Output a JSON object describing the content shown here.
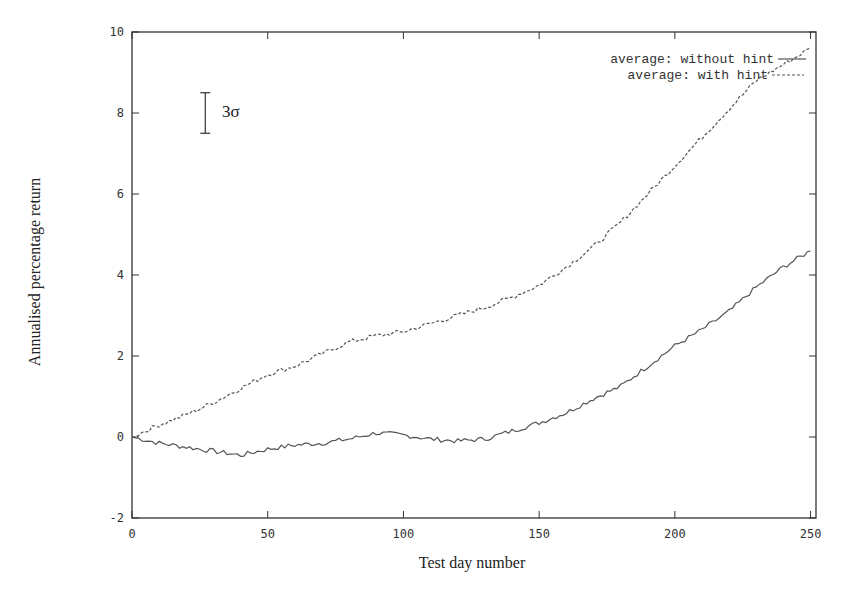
{
  "chart_data": {
    "type": "line",
    "title": "",
    "xlabel": "Test day number",
    "ylabel": "Annualised percentage return",
    "xlim": [
      0,
      252
    ],
    "ylim": [
      -2,
      10
    ],
    "xticks": [
      0,
      50,
      100,
      150,
      200,
      250
    ],
    "yticks": [
      -2,
      0,
      2,
      4,
      6,
      8,
      10
    ],
    "grid": false,
    "legend_position": "top-right",
    "annotation": {
      "label": "3σ",
      "type": "error-bar",
      "x": 27,
      "y_low": 7.5,
      "y_high": 8.5
    },
    "x": [
      0,
      10,
      20,
      30,
      40,
      50,
      60,
      70,
      80,
      90,
      100,
      110,
      120,
      130,
      140,
      150,
      160,
      170,
      180,
      190,
      200,
      210,
      220,
      230,
      240,
      250
    ],
    "series": [
      {
        "name": "average: without hint",
        "style": "solid",
        "values": [
          0,
          -0.15,
          -0.25,
          -0.35,
          -0.45,
          -0.3,
          -0.2,
          -0.15,
          -0.05,
          0.1,
          0.05,
          -0.05,
          -0.1,
          -0.05,
          0.15,
          0.35,
          0.6,
          0.95,
          1.25,
          1.75,
          2.25,
          2.65,
          3.1,
          3.7,
          4.2,
          4.6
        ]
      },
      {
        "name": "average: with hint",
        "style": "dashed",
        "values": [
          0,
          0.3,
          0.55,
          0.85,
          1.2,
          1.55,
          1.75,
          2.05,
          2.35,
          2.5,
          2.6,
          2.8,
          3.0,
          3.2,
          3.45,
          3.75,
          4.2,
          4.7,
          5.3,
          6.0,
          6.7,
          7.4,
          8.1,
          8.8,
          9.2,
          9.6
        ]
      }
    ]
  },
  "labels": {
    "xlabel": "Test day number",
    "ylabel": "Annualised percentage return",
    "legend_without": "average: without hint",
    "legend_with": "average: with hint",
    "sigma": "3σ"
  },
  "colors": {
    "axis": "#333333",
    "line": "#555555"
  }
}
